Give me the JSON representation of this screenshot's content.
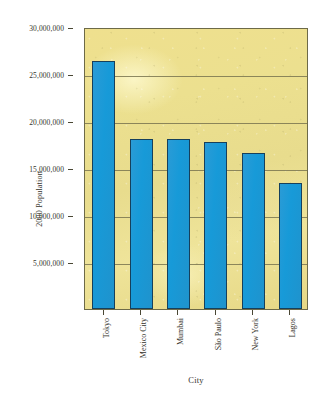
{
  "chart_data": {
    "type": "bar",
    "title": "",
    "xlabel": "City",
    "ylabel": "2000 Population",
    "categories": [
      "Tokyo",
      "Mexico City",
      "Mumbai",
      "São Paulo",
      "New York",
      "Lagos"
    ],
    "values": [
      26400000,
      18100000,
      18100000,
      17800000,
      16600000,
      13400000
    ],
    "ylim": [
      0,
      30000000
    ],
    "ytick_values": [
      5000000,
      10000000,
      15000000,
      20000000,
      25000000,
      30000000
    ],
    "ytick_labels": [
      "5,000,000",
      "10,000,000",
      "15,000,000",
      "20,000,000",
      "25,000,000",
      "30,000,000"
    ],
    "grid": true,
    "grid_axis": "y",
    "legend": false,
    "legend_position": "none",
    "bar_color": "#1f97d4",
    "bar_edge_color": "#16405c",
    "plot_background_color": "#ece08f",
    "gridline_color": "#7a7550",
    "axis_border_color": "#6d6a48",
    "page_background_color": "#ffffff"
  }
}
